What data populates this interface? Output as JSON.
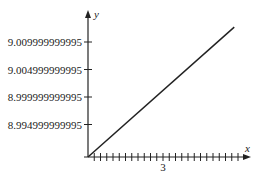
{
  "chart_data": {
    "type": "line",
    "title": "",
    "xlabel": "x",
    "ylabel": "y",
    "x_tick_labels": [
      {
        "value": 3,
        "label": "3"
      }
    ],
    "x_minor_tick_step": 0.25,
    "xlim": [
      0,
      6.25
    ],
    "y_tick_labels": [
      {
        "value": 9.009999999995,
        "label": "9.009999999995"
      },
      {
        "value": 9.004999999995,
        "label": "9.004999999995"
      },
      {
        "value": 8.999999999995,
        "label": "8.999999999995"
      },
      {
        "value": 8.994999999995,
        "label": "8.994999999995"
      }
    ],
    "ylim": [
      8.989,
      9.013
    ],
    "grid": false,
    "legend": null,
    "series": [
      {
        "name": "line",
        "x": [
          0,
          5.85
        ],
        "y": [
          8.989,
          9.0127
        ]
      }
    ]
  },
  "labels": {
    "x_axis": "x",
    "y_axis": "y",
    "x_tick_3": "3",
    "y_tick_0": "9.009999999995",
    "y_tick_1": "9.004999999995",
    "y_tick_2": "8.999999999995",
    "y_tick_3": "8.994999999995"
  }
}
